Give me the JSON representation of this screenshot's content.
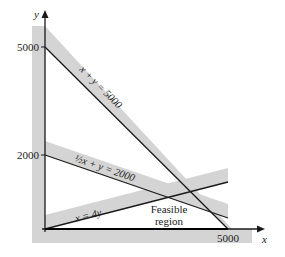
{
  "diagram": {
    "type": "linear-programming-feasible-region",
    "axes": {
      "x_label": "x",
      "y_label": "y",
      "x_ticks": [
        "5000"
      ],
      "y_ticks": [
        "5000",
        "2000"
      ]
    },
    "constraints": [
      {
        "id": "c1",
        "label": "x + y = 5000"
      },
      {
        "id": "c2",
        "label": "½x + y = 2000"
      },
      {
        "id": "c3",
        "label": "x = 4y"
      }
    ],
    "region_label_line1": "Feasible",
    "region_label_line2": "region",
    "colors": {
      "band": "#d4d4d4",
      "line": "#1a1a1a",
      "background": "#ffffff"
    }
  }
}
